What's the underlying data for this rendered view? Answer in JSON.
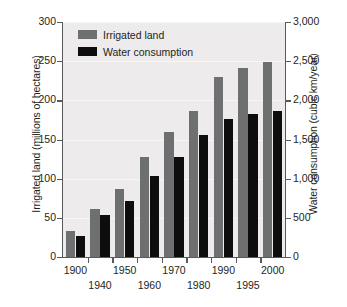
{
  "chart_data": {
    "type": "bar",
    "title": "",
    "subtitle": "",
    "xlabel": "",
    "categories": [
      "1900",
      "1940",
      "1950",
      "1960",
      "1970",
      "1980",
      "1990",
      "1995",
      "2000"
    ],
    "grid": true,
    "legend_position": "top-left",
    "series": [
      {
        "name": "Irrigated land",
        "color": "#6e6f71",
        "axis": "left",
        "unit": "millions of hectares",
        "values": [
          33,
          61,
          87,
          128,
          159,
          186,
          230,
          241,
          249
        ]
      },
      {
        "name": "Water consumption",
        "color": "#0d0d0d",
        "axis": "right",
        "unit": "cubic km/year",
        "values": [
          270,
          540,
          715,
          1040,
          1275,
          1560,
          1760,
          1830,
          1865
        ]
      }
    ],
    "axes": {
      "left": {
        "label": "Irrigated land (millions of hectares)",
        "ylim": [
          0,
          300
        ],
        "ticks": [
          0,
          50,
          100,
          150,
          200,
          250,
          300
        ],
        "ticklabels": [
          "0",
          "50",
          "100",
          "150",
          "200",
          "250",
          "300"
        ]
      },
      "right": {
        "label": "Water consumption (cubic km/year)",
        "ylim": [
          0,
          3000
        ],
        "ticks": [
          0,
          500,
          1000,
          1500,
          2000,
          2500,
          3000
        ],
        "ticklabels": [
          "0",
          "500",
          "1,000",
          "1,500",
          "2,000",
          "2,500",
          "3,000"
        ]
      }
    },
    "legend": [
      {
        "label": "Irrigated land",
        "color": "#6e6f71"
      },
      {
        "label": "Water consumption",
        "color": "#0d0d0d"
      }
    ],
    "colors": {
      "plot_background": "#edebeb",
      "axis": "#58595b",
      "gridline": "#f7f6f6",
      "text": "#231f20"
    }
  }
}
